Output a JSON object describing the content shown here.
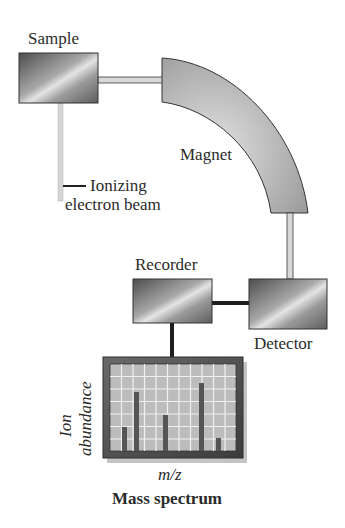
{
  "diagram": {
    "components": {
      "sample": {
        "label": "Sample"
      },
      "beam": {
        "label_line1": "Ionizing",
        "label_line2": "electron beam"
      },
      "magnet": {
        "label": "Magnet"
      },
      "detector": {
        "label": "Detector"
      },
      "recorder": {
        "label": "Recorder"
      },
      "spectrum": {
        "ylabel_line1": "Ion",
        "ylabel_line2": "abundance",
        "xlabel": "m/z",
        "caption": "Mass spectrum"
      }
    },
    "colors": {
      "box_dark": "#5a5a5a",
      "box_light": "#d8d8d8",
      "magnet_fill": "#b5b5b5",
      "grid_bg": "#b9b9b9",
      "grid_line": "#ececec",
      "bar": "#555555",
      "frame": "#4a4a4a",
      "tube": "#d0d0d0"
    },
    "spectrum_bars": [
      {
        "position": 1,
        "height_frac": 0.27
      },
      {
        "position": 2,
        "height_frac": 0.68
      },
      {
        "position": 5,
        "height_frac": 0.42
      },
      {
        "position": 8,
        "height_frac": 0.77
      },
      {
        "position": 10,
        "height_frac": 0.12
      }
    ]
  }
}
